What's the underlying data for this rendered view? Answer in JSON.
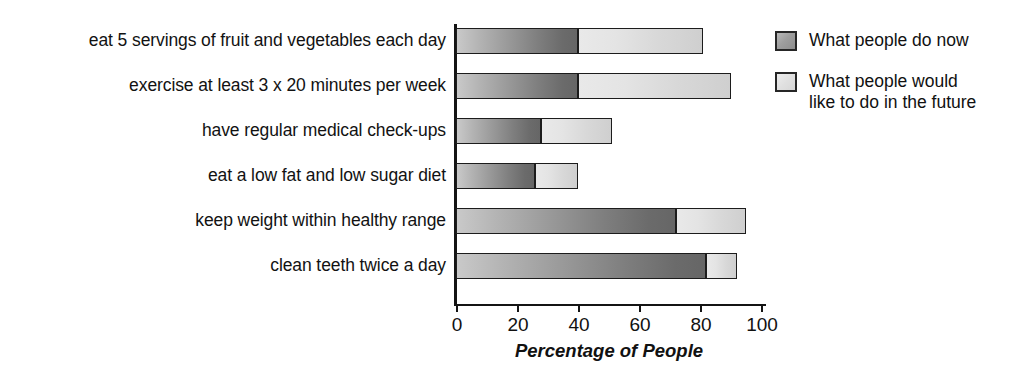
{
  "chart_data": {
    "type": "bar",
    "orientation": "horizontal",
    "stacked": true,
    "title": "",
    "xlabel": "Percentage of People",
    "ylabel": "",
    "xlim": [
      0,
      100
    ],
    "xticks": [
      0,
      20,
      40,
      60,
      80,
      100
    ],
    "xtick_labels": [
      "0",
      "20",
      "40",
      "60",
      "80",
      "100"
    ],
    "grid": false,
    "legend_position": "right",
    "categories": [
      "eat 5 servings of fruit and vegetables each day",
      "exercise at least 3 x 20 minutes per week",
      "have regular medical check-ups",
      "eat a low fat and low sugar diet",
      "keep weight within healthy range",
      "clean teeth twice a day"
    ],
    "series": [
      {
        "name": "What people do now",
        "color": "#8d8d8d",
        "values": [
          40,
          40,
          28,
          26,
          72,
          82
        ]
      },
      {
        "name": "What people would like to do in the future",
        "color": "#dedede",
        "values": [
          41,
          50,
          23,
          14,
          23,
          10
        ]
      }
    ],
    "cumulative_totals": [
      81,
      90,
      51,
      40,
      95,
      92
    ]
  },
  "axis": {
    "x_title": "Percentage of People",
    "tick_labels": [
      "0",
      "20",
      "40",
      "60",
      "80",
      "100"
    ]
  },
  "legend": {
    "items": [
      {
        "label": "What people do now",
        "swatch": "now"
      },
      {
        "label": "What people would\nlike to do in the future",
        "swatch": "future"
      }
    ]
  },
  "categories": [
    "eat 5 servings of fruit and vegetables each day",
    "exercise at least 3 x 20 minutes per week",
    "have regular medical check-ups",
    "eat a low fat and low sugar diet",
    "keep weight within healthy range",
    "clean teeth twice a day"
  ]
}
